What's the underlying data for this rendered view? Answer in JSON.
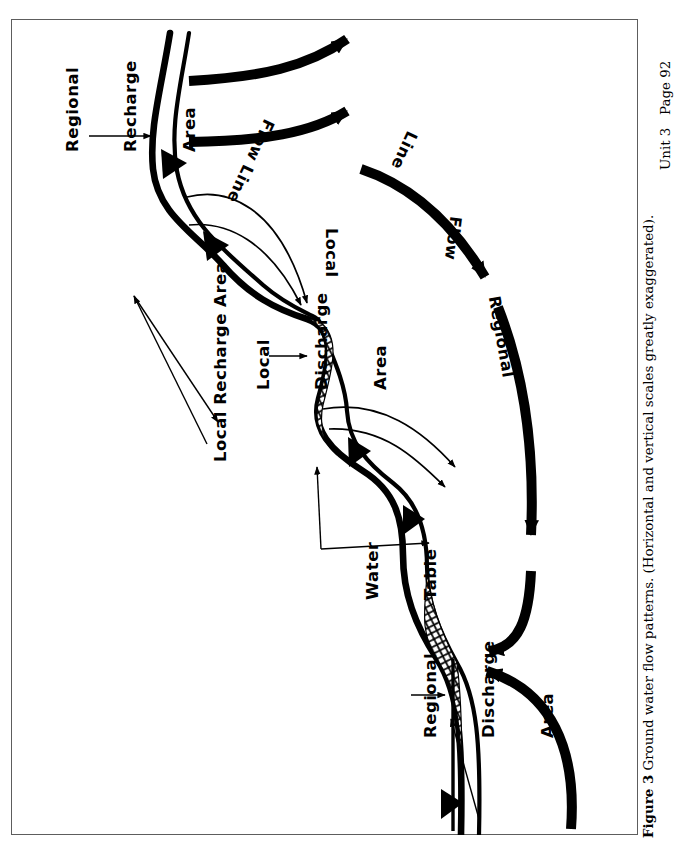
{
  "page": {
    "header_right": "Unit 3   Page 92",
    "caption_figure_number": "Figure 3",
    "caption_text": " Ground water flow patterns. (Horizontal and vertical scales greatly exaggerated).",
    "background_color": "#ffffff",
    "ink_color": "#000000",
    "frame_color": "#5d5d5d"
  },
  "figure": {
    "title": "Ground water flow patterns",
    "type": "cross-section-schematic",
    "orientation_note": "Diagram drawn rotated 90 degrees on the page; labels read bottom-to-top.",
    "labels": [
      {
        "id": "regional-recharge-area",
        "text": "Regional\nRecharge\nArea",
        "lines": [
          "Regional",
          "Recharge",
          "Area"
        ]
      },
      {
        "id": "local-recharge-area",
        "text": "Local Recharge Area",
        "lines": [
          "Local Recharge Area"
        ]
      },
      {
        "id": "local-discharge-area",
        "text": "Local\nDischarge\nArea",
        "lines": [
          "Local",
          "Discharge",
          "Area"
        ]
      },
      {
        "id": "local-flow-line",
        "text": "Local\nFlow Line",
        "lines": [
          "Local",
          "Flow Line"
        ]
      },
      {
        "id": "regional-flow-line",
        "text": "Regional\nFlow\nLine",
        "lines": [
          "Regional",
          "Flow",
          "Line"
        ]
      },
      {
        "id": "water-table",
        "text": "Water\nTable",
        "lines": [
          "Water",
          "Table"
        ]
      },
      {
        "id": "regional-discharge-area",
        "text": "Regional\nDischarge\nArea",
        "lines": [
          "Regional",
          "Discharge",
          "Area"
        ]
      }
    ],
    "label_text": {
      "regional_recharge_l1": "Regional",
      "regional_recharge_l2": "Recharge",
      "regional_recharge_l3": "Area",
      "local_recharge_area": "Local Recharge Area",
      "local_discharge_l1": "Local",
      "local_discharge_l2": "Discharge",
      "local_discharge_l3": "Area",
      "local_flow_l1": "Local",
      "local_flow_l2": "Flow Line",
      "regional_flow_l1": "Regional",
      "regional_flow_l2": "Flow",
      "regional_flow_l3": "Line",
      "water_table_l1": "Water",
      "water_table_l2": "Table",
      "regional_discharge_l1": "Regional",
      "regional_discharge_l2": "Discharge",
      "regional_discharge_l3": "Area"
    },
    "elements": {
      "land_surface_curve": "undulating ground surface profile",
      "water_table_curve": "subdued replica of land surface",
      "thick_flow_arrows": "bold black arrows showing regional and local ground water flow",
      "thin_flow_arrows": "thin arrows showing local flow lines",
      "cross_hatched_zones": "seepage / discharge zones shown with cross-hatch pattern",
      "cross_hatch_count": 2,
      "leader_lines": "thin pointer lines connecting labels to features"
    }
  }
}
